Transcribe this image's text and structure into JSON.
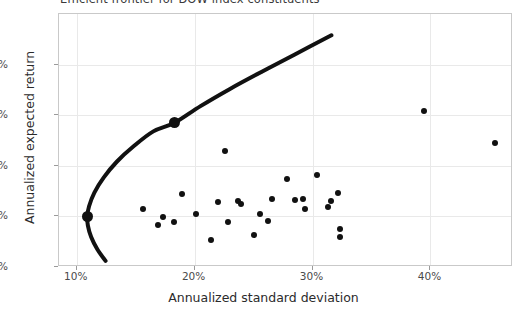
{
  "chart_data": {
    "type": "scatter",
    "title": "Efficient frontier for DOW index constituents",
    "xlabel": "Annualized standard deviation",
    "ylabel": "Annualized expected return",
    "xlim": [
      0.085,
      0.47
    ],
    "ylim": [
      0.0,
      0.5
    ],
    "grid": true,
    "legend": "none",
    "xticks": [
      {
        "value": 0.1,
        "label": "10%"
      },
      {
        "value": 0.2,
        "label": "20%"
      },
      {
        "value": 0.3,
        "label": "30%"
      },
      {
        "value": 0.4,
        "label": "40%"
      }
    ],
    "yticks": [
      {
        "value": 0.0,
        "label": "0%"
      },
      {
        "value": 0.1,
        "label": "10%"
      },
      {
        "value": 0.2,
        "label": "20%"
      },
      {
        "value": 0.3,
        "label": "30%"
      },
      {
        "value": 0.4,
        "label": "40%"
      }
    ],
    "series": [
      {
        "name": "Efficient frontier",
        "type": "line",
        "color": "#111111",
        "linewidth": 4,
        "points": [
          {
            "x": 0.1245,
            "y": 0.012
          },
          {
            "x": 0.1175,
            "y": 0.035
          },
          {
            "x": 0.1122,
            "y": 0.06
          },
          {
            "x": 0.1095,
            "y": 0.082
          },
          {
            "x": 0.109,
            "y": 0.1
          },
          {
            "x": 0.1105,
            "y": 0.12
          },
          {
            "x": 0.115,
            "y": 0.147
          },
          {
            "x": 0.123,
            "y": 0.177
          },
          {
            "x": 0.134,
            "y": 0.208
          },
          {
            "x": 0.148,
            "y": 0.238
          },
          {
            "x": 0.165,
            "y": 0.268
          },
          {
            "x": 0.183,
            "y": 0.285
          },
          {
            "x": 0.205,
            "y": 0.318
          },
          {
            "x": 0.23,
            "y": 0.352
          },
          {
            "x": 0.257,
            "y": 0.386
          },
          {
            "x": 0.285,
            "y": 0.42
          },
          {
            "x": 0.316,
            "y": 0.458
          }
        ]
      },
      {
        "name": "Highlighted portfolios",
        "type": "marker",
        "color": "#111111",
        "markersize": 11,
        "points": [
          {
            "x": 0.109,
            "y": 0.1,
            "note": "minimum variance portfolio"
          },
          {
            "x": 0.183,
            "y": 0.285,
            "note": "tangency / target portfolio"
          }
        ]
      },
      {
        "name": "Individual DOW constituents",
        "type": "marker",
        "color": "#111111",
        "markersize": 6,
        "points": [
          {
            "x": 0.1565,
            "y": 0.1145
          },
          {
            "x": 0.169,
            "y": 0.0835
          },
          {
            "x": 0.173,
            "y": 0.099
          },
          {
            "x": 0.1825,
            "y": 0.089
          },
          {
            "x": 0.189,
            "y": 0.145
          },
          {
            "x": 0.201,
            "y": 0.1045
          },
          {
            "x": 0.2135,
            "y": 0.0535
          },
          {
            "x": 0.22,
            "y": 0.1275
          },
          {
            "x": 0.2255,
            "y": 0.2295
          },
          {
            "x": 0.2285,
            "y": 0.088
          },
          {
            "x": 0.237,
            "y": 0.1295
          },
          {
            "x": 0.2395,
            "y": 0.1245
          },
          {
            "x": 0.25,
            "y": 0.0635
          },
          {
            "x": 0.2555,
            "y": 0.1055
          },
          {
            "x": 0.2625,
            "y": 0.09
          },
          {
            "x": 0.266,
            "y": 0.1345
          },
          {
            "x": 0.2785,
            "y": 0.1745
          },
          {
            "x": 0.2855,
            "y": 0.132
          },
          {
            "x": 0.292,
            "y": 0.1345
          },
          {
            "x": 0.294,
            "y": 0.1155
          },
          {
            "x": 0.3035,
            "y": 0.1825
          },
          {
            "x": 0.313,
            "y": 0.1195
          },
          {
            "x": 0.3155,
            "y": 0.131
          },
          {
            "x": 0.322,
            "y": 0.146
          },
          {
            "x": 0.323,
            "y": 0.076
          },
          {
            "x": 0.323,
            "y": 0.059
          },
          {
            "x": 0.3945,
            "y": 0.309
          },
          {
            "x": 0.4545,
            "y": 0.245
          }
        ]
      }
    ]
  }
}
